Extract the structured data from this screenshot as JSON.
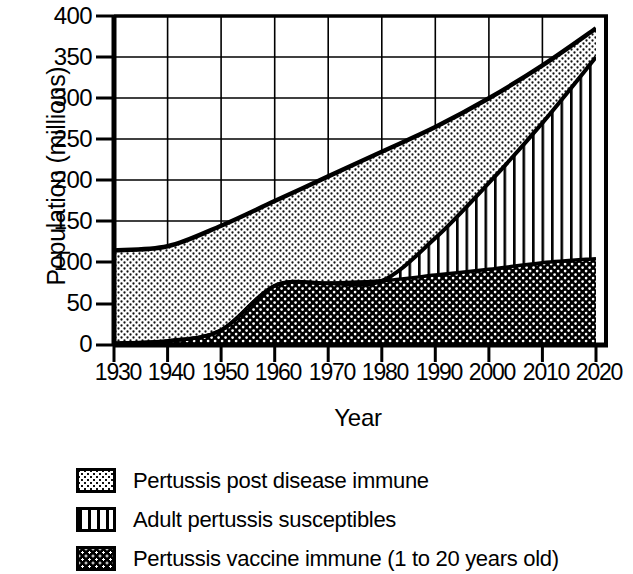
{
  "chart_data": {
    "type": "area",
    "title": "",
    "subtitle": "",
    "xlabel": "Year",
    "ylabel": "Population (millions)",
    "x": [
      1930,
      1940,
      1950,
      1960,
      1970,
      1980,
      1990,
      2000,
      2010,
      2020
    ],
    "categories": [
      "1930",
      "1940",
      "1950",
      "1960",
      "1970",
      "1980",
      "1990",
      "2000",
      "2010",
      "2020"
    ],
    "xlim": [
      1930,
      2020
    ],
    "ylim": [
      0,
      400
    ],
    "y_ticks": [
      0,
      50,
      100,
      150,
      200,
      250,
      300,
      350,
      400
    ],
    "x_ticks": [
      1930,
      1940,
      1950,
      1960,
      1970,
      1980,
      1990,
      2000,
      2010,
      2020
    ],
    "grid": true,
    "legend_position": "below",
    "stacked": true,
    "series": [
      {
        "name": "Pertussis vaccine immune (1 to 20 years old)",
        "pattern": "dark-cross-hatch",
        "color": "#000000",
        "values": [
          2,
          5,
          18,
          72,
          75,
          78,
          85,
          92,
          100,
          105
        ]
      },
      {
        "name": "Adult pertussis susceptibles",
        "pattern": "vertical-stripes",
        "color": "#ffffff",
        "values": [
          0,
          0,
          0,
          0,
          0,
          0,
          45,
          105,
          170,
          245
        ]
      },
      {
        "name": "Pertussis post disease immune",
        "pattern": "light-dots",
        "color": "#f2f2f2",
        "values": [
          113,
          115,
          127,
          103,
          130,
          157,
          135,
          103,
          70,
          35
        ]
      }
    ],
    "cumulative_totals": [
      115,
      120,
      145,
      175,
      205,
      235,
      265,
      300,
      340,
      385
    ],
    "boundary_vaccine_immune": [
      2,
      5,
      18,
      72,
      75,
      78,
      85,
      92,
      100,
      105
    ],
    "boundary_susceptibles_top": [
      2,
      5,
      18,
      72,
      75,
      78,
      130,
      197,
      270,
      350
    ],
    "boundary_total_top": [
      115,
      120,
      145,
      175,
      205,
      235,
      265,
      300,
      340,
      385
    ]
  },
  "legend": {
    "items": [
      {
        "label": "Pertussis post disease immune",
        "swatch": "light-dots-swatch"
      },
      {
        "label": "Adult pertussis susceptibles",
        "swatch": "vertical-stripes-swatch"
      },
      {
        "label": "Pertussis vaccine immune (1 to 20 years old)",
        "swatch": "dark-cross-hatch-swatch"
      }
    ]
  },
  "axes": {
    "y_title": "Population (millions)",
    "x_title": "Year",
    "y_tick_labels": [
      "400",
      "350",
      "300",
      "250",
      "200",
      "150",
      "100",
      "50",
      "0"
    ],
    "x_tick_labels": [
      "1930",
      "1940",
      "1950",
      "1960",
      "1970",
      "1980",
      "1990",
      "2000",
      "2010",
      "2020"
    ]
  },
  "colors": {
    "axis": "#000000",
    "grid": "#000000",
    "background": "#ffffff",
    "dots_fill": "#f4f4f4",
    "stripes_fill": "#ffffff",
    "hatch_fill": "#000000"
  }
}
